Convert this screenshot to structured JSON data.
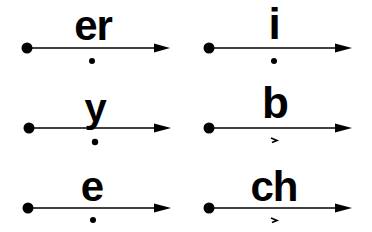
{
  "colors": {
    "ink": "#000000",
    "background": "#ffffff"
  },
  "panels": [
    {
      "id": "er",
      "label": "er",
      "mark": "dot"
    },
    {
      "id": "i",
      "label": "i",
      "mark": "dot"
    },
    {
      "id": "y",
      "label": "y",
      "mark": "dot"
    },
    {
      "id": "b",
      "label": "b",
      "mark": "short-stroke"
    },
    {
      "id": "e",
      "label": "e",
      "mark": "dot"
    },
    {
      "id": "ch",
      "label": "ch",
      "mark": "short-stroke"
    }
  ]
}
